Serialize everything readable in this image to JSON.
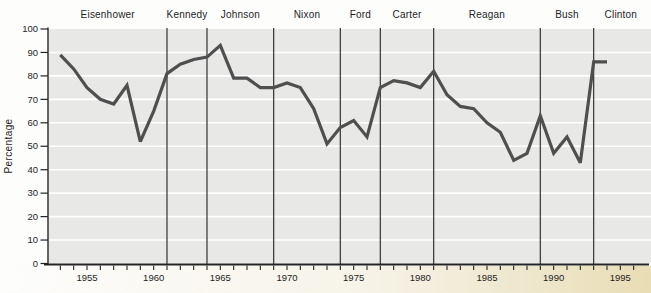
{
  "chart_data": {
    "type": "line",
    "title": "",
    "ylabel": "Percentage",
    "xlabel": "",
    "ylim": [
      0,
      100
    ],
    "xlim": [
      1952,
      1997
    ],
    "grid": "horizontal-white-lines-every-10",
    "legend": "none",
    "y_ticks": [
      0,
      10,
      20,
      30,
      40,
      50,
      60,
      70,
      80,
      90,
      100
    ],
    "x_tick_labels": [
      "1955",
      "1960",
      "1965",
      "1970",
      "1975",
      "1980",
      "1985",
      "1990",
      "1995"
    ],
    "x": [
      1953,
      1954,
      1955,
      1956,
      1957,
      1958,
      1959,
      1960,
      1961,
      1962,
      1963,
      1964,
      1965,
      1966,
      1967,
      1968,
      1969,
      1970,
      1971,
      1972,
      1973,
      1974,
      1975,
      1976,
      1977,
      1978,
      1979,
      1980,
      1981,
      1982,
      1983,
      1984,
      1985,
      1986,
      1987,
      1988,
      1989,
      1990,
      1991,
      1992,
      1993,
      1994
    ],
    "values": [
      89,
      83,
      75,
      70,
      68,
      76,
      52,
      65,
      81,
      85,
      87,
      88,
      93,
      79,
      79,
      75,
      75,
      77,
      75,
      66,
      51,
      58,
      61,
      54,
      75,
      78,
      77,
      75,
      82,
      72,
      67,
      66,
      60,
      56,
      44,
      47,
      63,
      47,
      54,
      43,
      86,
      86
    ],
    "presidents": [
      {
        "name": "Eisenhower",
        "start": 1953
      },
      {
        "name": "Kennedy",
        "start": 1961
      },
      {
        "name": "Johnson",
        "start": 1964
      },
      {
        "name": "Nixon",
        "start": 1969
      },
      {
        "name": "Ford",
        "start": 1974
      },
      {
        "name": "Carter",
        "start": 1977
      },
      {
        "name": "Reagan",
        "start": 1981
      },
      {
        "name": "Bush",
        "start": 1989
      },
      {
        "name": "Clinton",
        "start": 1993
      }
    ],
    "colors": {
      "line": "#4f4f4f",
      "plot_bg": "#e8e8e6",
      "gridline": "#ffffff",
      "divider": "#3a3a3a",
      "axis": "#242424",
      "text": "#1e1e1e",
      "page_bg": "#fdfdfc",
      "bottom_tint": "#e5d7a8"
    }
  }
}
